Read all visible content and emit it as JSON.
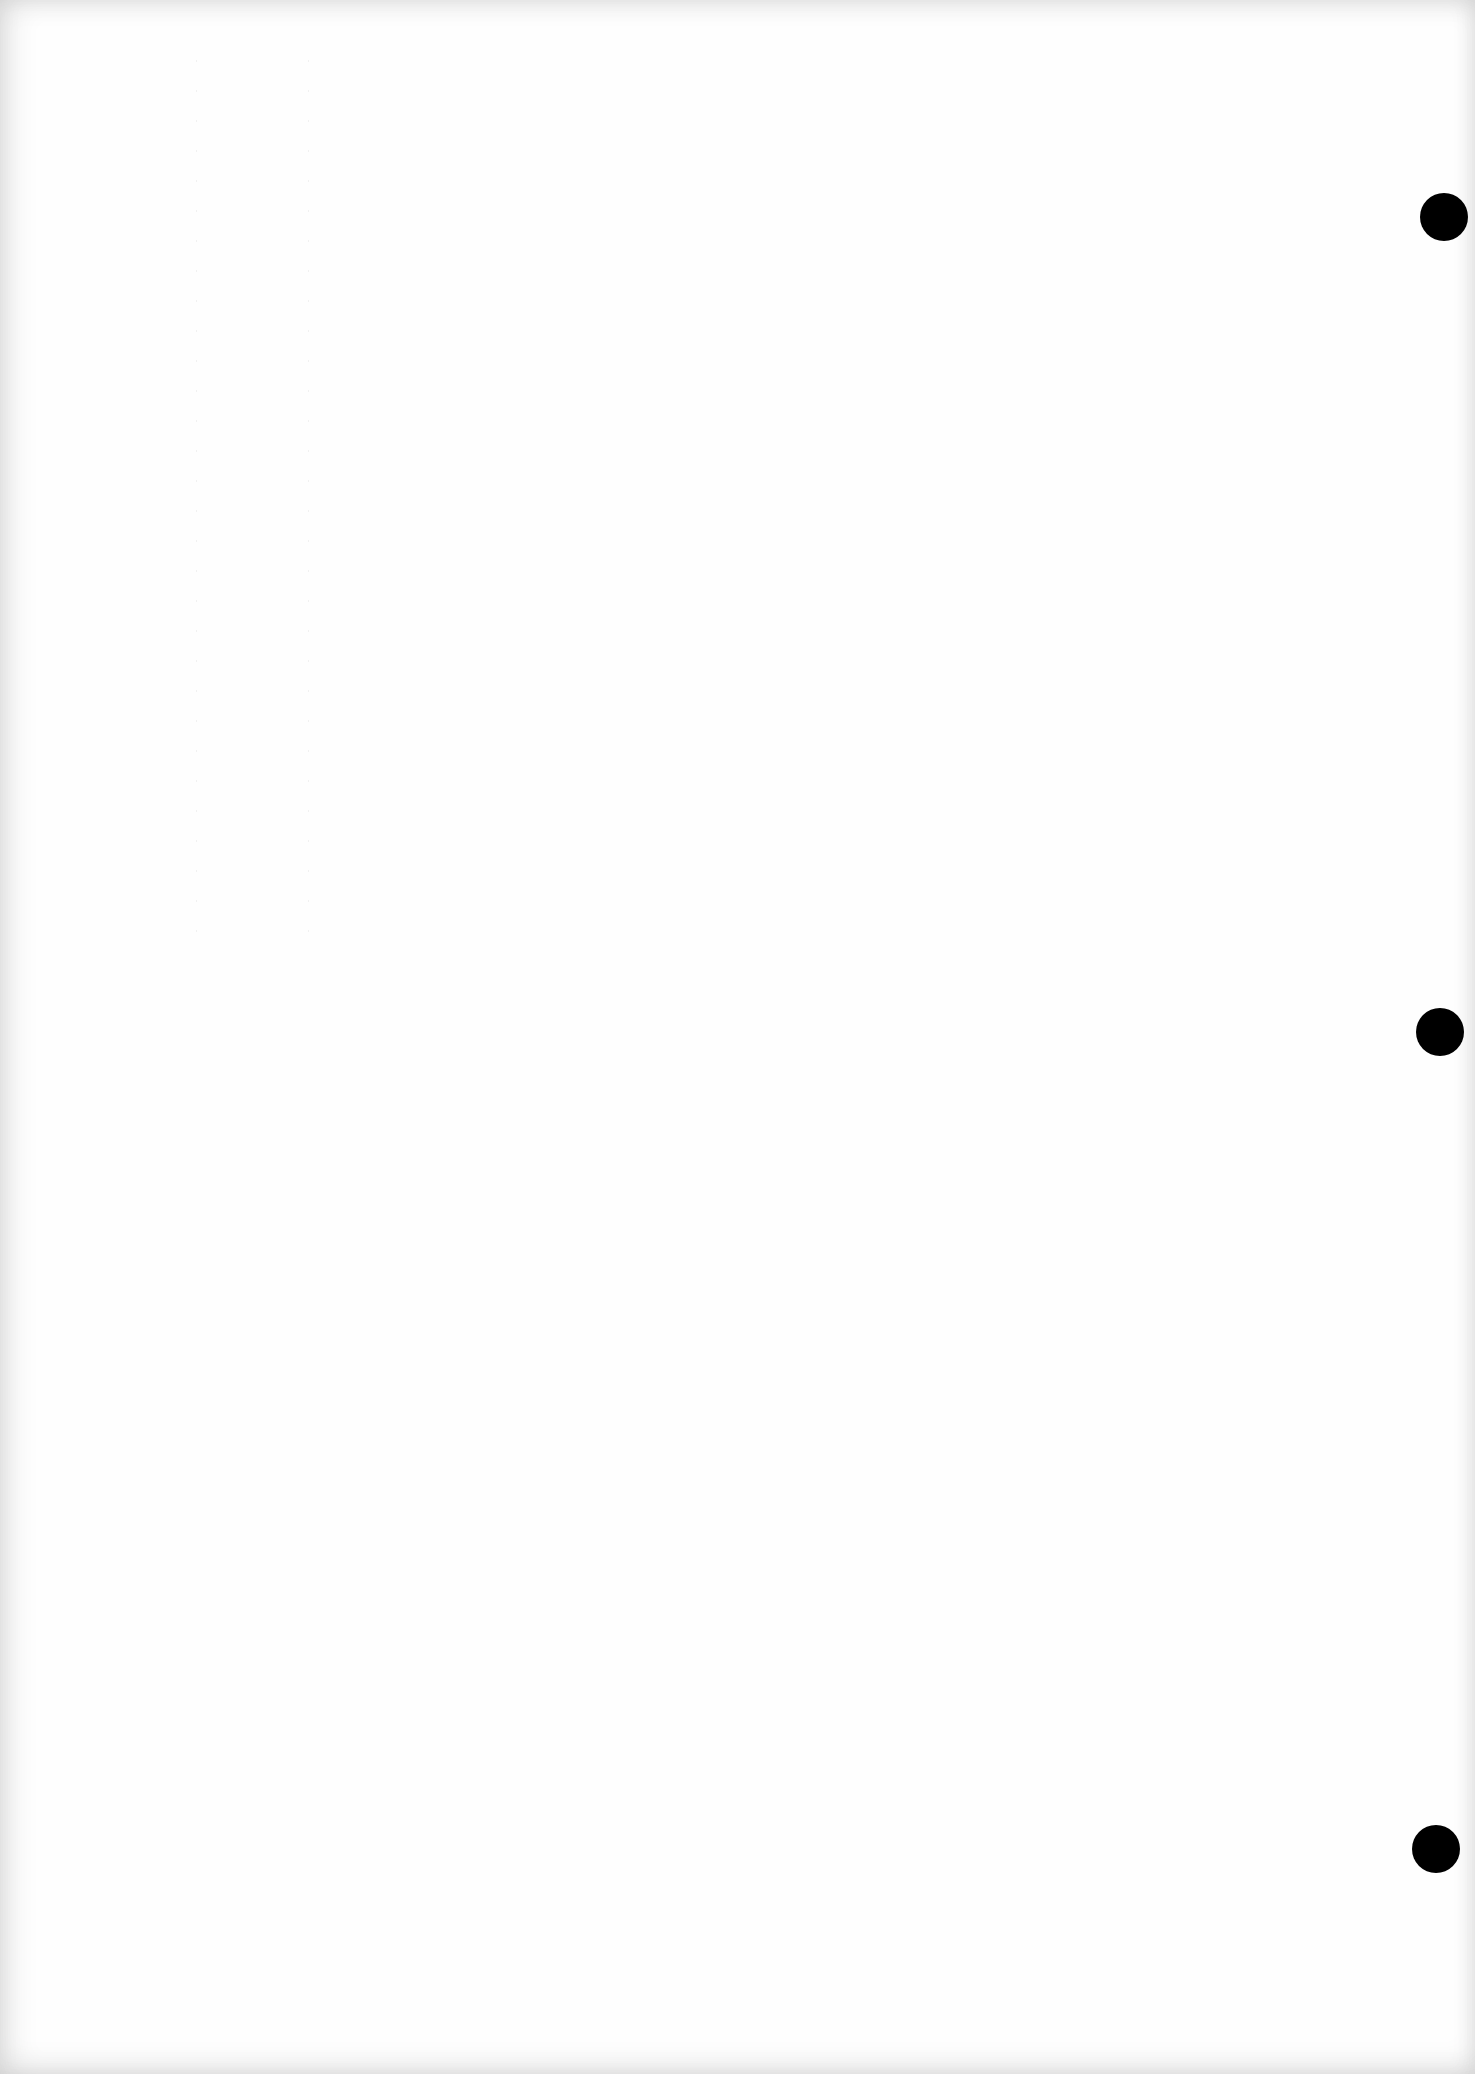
{
  "document": {
    "type": "blank scanned page",
    "text": "",
    "punch_holes": [
      {
        "x": 1444,
        "y": 217,
        "r": 24
      },
      {
        "x": 1440,
        "y": 1032,
        "r": 24
      },
      {
        "x": 1436,
        "y": 1849,
        "r": 24
      }
    ],
    "colors": {
      "paper": "#fefefe",
      "hole": "#000000"
    }
  }
}
